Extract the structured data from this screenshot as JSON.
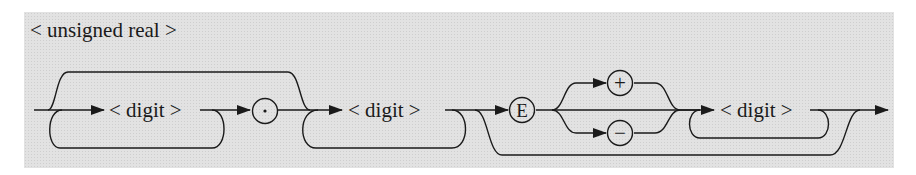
{
  "title": "< unsigned real >",
  "nodes": {
    "digit1": "< digit >",
    "point": "·",
    "digit2": "< digit >",
    "exp": "E",
    "plus": "+",
    "minus": "−",
    "digit3": "< digit >"
  },
  "colors": {
    "background": "#e2e2e2",
    "stroke": "#1a1a1a"
  }
}
